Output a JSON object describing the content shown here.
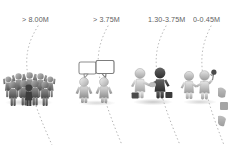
{
  "diagram": {
    "background_color": "#ffffff",
    "label_color": "#3a3a3a",
    "divider_style": "dotted-arc",
    "divider_color": "#9a9a9a",
    "segments": [
      {
        "label": "> 8.00M",
        "label_x": 22,
        "label_y": 15,
        "icon": "crowd-of-people-icon",
        "icon_description": "large crowd of figures with raised arms",
        "icon_x": 2,
        "icon_y": 68,
        "icon_w": 54,
        "icon_h": 38,
        "figure_count": 11
      },
      {
        "label": "> 3.75M",
        "label_x": 93,
        "label_y": 15,
        "icon": "two-people-talking-icon",
        "icon_description": "two figures with speech bubbles",
        "icon_x": 74,
        "icon_y": 62,
        "icon_w": 46,
        "icon_h": 44,
        "figure_count": 2
      },
      {
        "label": "1.30-3.75M",
        "label_x": 148,
        "label_y": 15,
        "icon": "handshake-deal-icon",
        "icon_description": "two figures shaking hands with briefcases",
        "icon_x": 130,
        "icon_y": 66,
        "icon_w": 46,
        "icon_h": 38,
        "figure_count": 2
      },
      {
        "label": "0-0.45M",
        "label_x": 193,
        "label_y": 15,
        "icon": "gift-flower-exchange-icon",
        "icon_description": "two figures, one holding a flower",
        "icon_x": 181,
        "icon_y": 66,
        "icon_w": 42,
        "icon_h": 38,
        "figure_count": 2
      }
    ],
    "dividers": [
      {
        "name": "divider-1",
        "top_x": 38,
        "mid_x": 20,
        "bottom_x": 52
      },
      {
        "name": "divider-2",
        "top_x": 108,
        "mid_x": 92,
        "bottom_x": 122
      },
      {
        "name": "divider-3",
        "top_x": 166,
        "mid_x": 150,
        "bottom_x": 180
      },
      {
        "name": "divider-4",
        "top_x": 211,
        "mid_x": 196,
        "bottom_x": 224
      }
    ],
    "edge_sliver": {
      "name": "cropped-figure-sliver",
      "x": 218,
      "y": 86,
      "w": 10,
      "h": 40
    }
  }
}
